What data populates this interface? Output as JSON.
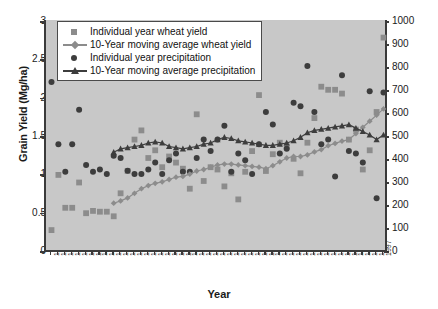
{
  "chart_data": {
    "type": "scatter",
    "title": "",
    "xlabel": "Year",
    "ylabel": "Grain Yield (Mg/ha)",
    "y2label": "Precipitation (mm)",
    "ylim": [
      0,
      3
    ],
    "y2lim": [
      0,
      1000
    ],
    "yticks": [
      "0",
      "0.5",
      "1",
      "1.5",
      "2",
      "2.5",
      "3"
    ],
    "y2ticks": [
      "0",
      "100",
      "200",
      "300",
      "400",
      "500",
      "600",
      "700",
      "800",
      "900",
      "1000"
    ],
    "grid": false,
    "legend_position": "top-left",
    "plot_background": "#c8c8c8",
    "colors": {
      "wheat_yield_marker": "#8c8c8c",
      "wheat_yield_ma": "#8c8c8c",
      "precipitation_marker": "#3d3d3d",
      "precipitation_ma": "#3d3d3d",
      "axis": "#3a3a3a"
    },
    "categories": [
      "1949",
      "1950",
      "1951",
      "1952",
      "1953",
      "1954",
      "1955",
      "1956",
      "1957",
      "1958",
      "1959",
      "1960",
      "1961",
      "1962",
      "1963",
      "1964",
      "1965",
      "1966",
      "1967",
      "1968",
      "1969",
      "1970",
      "1971",
      "1972",
      "1973",
      "1974",
      "1975",
      "1976",
      "1977",
      "1978",
      "1979",
      "1980",
      "1981",
      "1982",
      "1983",
      "1984",
      "1985",
      "1986",
      "1987",
      "1988",
      "1989",
      "1990",
      "1991",
      "1992",
      "1993",
      "1994",
      "1995",
      "1996",
      "1997"
    ],
    "series": [
      {
        "name": "Individual year wheat yield",
        "marker": "square",
        "axis": "left",
        "values": [
          0.26,
          0.98,
          0.55,
          0.55,
          0.88,
          0.48,
          0.51,
          0.5,
          0.5,
          0.44,
          0.74,
          1.03,
          1.44,
          1.56,
          1.2,
          1.3,
          1.08,
          1.22,
          1.14,
          1.06,
          0.8,
          1.77,
          0.9,
          1.08,
          1.05,
          0.83,
          1.0,
          0.66,
          1.02,
          1.29,
          2.02,
          1.03,
          1.25,
          1.4,
          1.35,
          1.19,
          1.0,
          1.4,
          1.72,
          2.13,
          2.09,
          2.09,
          2.04,
          1.44,
          1.57,
          1.05,
          1.3,
          1.8,
          2.77
        ]
      },
      {
        "name": "10-Year moving average wheat yield",
        "marker": "diamond",
        "line": true,
        "axis": "left",
        "values": [
          null,
          null,
          null,
          null,
          null,
          null,
          null,
          null,
          null,
          0.61,
          0.64,
          0.68,
          0.74,
          0.8,
          0.84,
          0.87,
          0.89,
          0.92,
          0.95,
          0.96,
          0.99,
          1.03,
          1.05,
          1.08,
          1.11,
          1.12,
          1.12,
          1.11,
          1.1,
          1.09,
          1.08,
          1.06,
          1.1,
          1.15,
          1.2,
          1.22,
          1.22,
          1.24,
          1.28,
          1.31,
          1.36,
          1.39,
          1.42,
          1.44,
          1.52,
          1.6,
          1.68,
          1.76,
          1.84
        ]
      },
      {
        "name": "Individual year precipitation",
        "marker": "circle",
        "axis": "right",
        "values": [
          730,
          460,
          340,
          460,
          610,
          370,
          340,
          350,
          330,
          410,
          400,
          345,
          330,
          330,
          350,
          380,
          330,
          390,
          420,
          340,
          340,
          400,
          480,
          430,
          480,
          540,
          340,
          420,
          390,
          330,
          460,
          600,
          545,
          420,
          440,
          640,
          625,
          800,
          600,
          460,
          480,
          320,
          760,
          430,
          420,
          380,
          690,
          225,
          685
        ]
      },
      {
        "name": "10-Year moving average precipitation",
        "marker": "triangle",
        "line": true,
        "axis": "right",
        "values": [
          null,
          null,
          null,
          null,
          null,
          null,
          null,
          null,
          null,
          425,
          440,
          445,
          450,
          455,
          465,
          470,
          465,
          450,
          445,
          440,
          445,
          450,
          460,
          465,
          480,
          490,
          485,
          475,
          470,
          465,
          460,
          455,
          455,
          460,
          465,
          475,
          490,
          510,
          520,
          525,
          530,
          535,
          540,
          545,
          530,
          515,
          500,
          480,
          500
        ]
      }
    ]
  },
  "legend": {
    "items": [
      {
        "label": "Individual year wheat yield",
        "marker": "square",
        "icon": "square-marker-icon"
      },
      {
        "label": "10-Year moving average wheat yield",
        "marker": "line-diamond",
        "icon": "line-diamond-marker-icon"
      },
      {
        "label": "Individual year precipitation",
        "marker": "circle",
        "icon": "circle-marker-icon"
      },
      {
        "label": "10-Year moving average precipitation",
        "marker": "line-triangle",
        "icon": "line-triangle-marker-icon"
      }
    ]
  }
}
